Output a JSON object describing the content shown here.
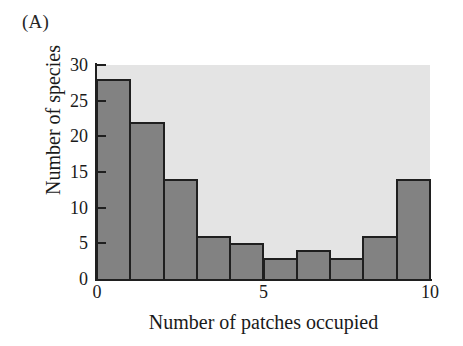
{
  "figure": {
    "panel_label": "(A)",
    "background_color": "#ffffff",
    "plot_background_color": "#e4e4e4",
    "bar_fill_color": "#828282",
    "bar_edge_color": "#1f1f1f",
    "axis_color": "#1f1f1f"
  },
  "chart_data": {
    "type": "bar",
    "title": "(A)",
    "xlabel": "Number of patches occupied",
    "ylabel": "Number of species",
    "categories": [
      "0-1",
      "1-2",
      "2-3",
      "3-4",
      "4-5",
      "5-6",
      "6-7",
      "7-8",
      "8-9",
      "9-10"
    ],
    "bin_edges": [
      0,
      1,
      2,
      3,
      4,
      5,
      6,
      7,
      8,
      9,
      10
    ],
    "values": [
      28,
      22,
      14,
      6,
      5,
      3,
      4,
      3,
      6,
      14
    ],
    "xlim": [
      0,
      10
    ],
    "ylim": [
      0,
      30
    ],
    "xticks": [
      0,
      5,
      10
    ],
    "xtick_labels": [
      "0",
      "5",
      "10"
    ],
    "yticks": [
      0,
      5,
      10,
      15,
      20,
      25,
      30
    ],
    "ytick_labels": [
      "0",
      "5",
      "10",
      "15",
      "20",
      "25",
      "30"
    ],
    "grid": false,
    "legend": null
  }
}
